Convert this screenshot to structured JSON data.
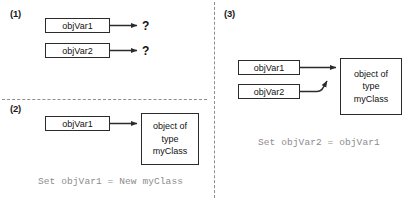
{
  "figure": {
    "background": "#ffffff",
    "line_color": "#2b2b2b",
    "caption_color": "#8d8d8d"
  },
  "panels": [
    {
      "label": "(1)",
      "boxes": [
        {
          "text": "objVar1"
        },
        {
          "text": "objVar2"
        }
      ],
      "targets": [
        {
          "text": "?"
        },
        {
          "text": "?"
        }
      ],
      "caption": ""
    },
    {
      "label": "(2)",
      "boxes": [
        {
          "text": "objVar1"
        }
      ],
      "object_box": {
        "line1": "object of",
        "line2": "type",
        "line3": "myClass"
      },
      "caption": "Set objVar1 = New myClass"
    },
    {
      "label": "(3)",
      "boxes": [
        {
          "text": "objVar1"
        },
        {
          "text": "objVar2"
        }
      ],
      "object_box": {
        "line1": "object of",
        "line2": "type",
        "line3": "myClass"
      },
      "caption": "Set objVar2 = objVar1"
    }
  ]
}
